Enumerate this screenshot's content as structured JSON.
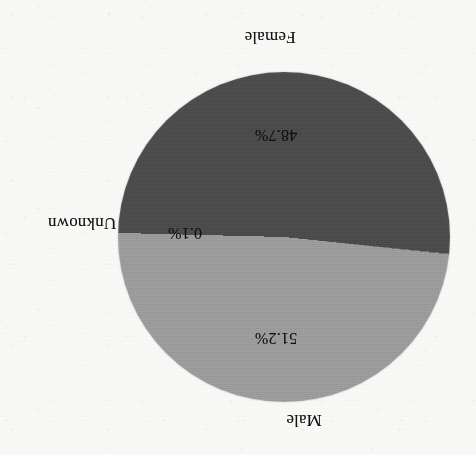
{
  "figure": {
    "kind": "pie-chart",
    "orientation": "rotated-180"
  },
  "colors": {
    "male": "#9a9a9a",
    "female": "#4a4a4a",
    "unknown": "#6f6f6f",
    "background": "#f8f8f6",
    "text": "#1a1a1a"
  },
  "labels": {
    "male": "Male",
    "female": "Female",
    "unknown": "Unknown"
  },
  "percent_labels": {
    "male": "48.7%",
    "female": "51.2%",
    "unknown": "0.1%"
  },
  "chart_data": {
    "type": "pie",
    "title": "",
    "subtitle": "",
    "xlabel": "",
    "ylabel": "",
    "categories": [
      "Female",
      "Unknown",
      "Male"
    ],
    "values": [
      51.2,
      0.1,
      48.7
    ],
    "value_unit": "percent",
    "data_labels": [
      "51.2%",
      "0.1%",
      "48.7%"
    ],
    "slice_colors": [
      "#4a4a4a",
      "#6f6f6f",
      "#9a9a9a"
    ],
    "legend": "none",
    "legend_position": "outside-labels",
    "grid": false,
    "annotations": [
      "Male 48.7%",
      "Female 51.2%",
      "Unknown 0.1%"
    ],
    "total": 100.0,
    "start_angle_deg": 90,
    "direction": "clockwise"
  }
}
